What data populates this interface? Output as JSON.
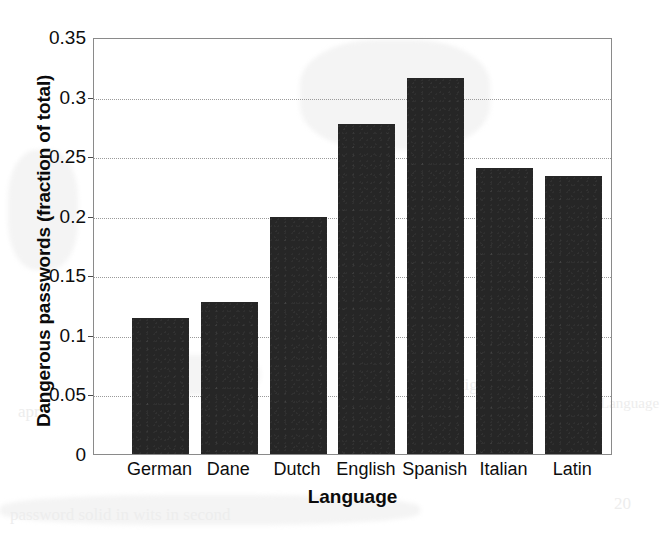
{
  "chart_data": {
    "type": "bar",
    "title": "",
    "subtitle": "",
    "xlabel": "Language",
    "ylabel": "Dangerous passwords (fraction of total)",
    "categories": [
      "German",
      "Dane",
      "Dutch",
      "English",
      "Spanish",
      "Italian",
      "Latin"
    ],
    "values": [
      0.114,
      0.128,
      0.199,
      0.277,
      0.316,
      0.24,
      0.233
    ],
    "series": [
      {
        "name": "Dangerous passwords",
        "values": [
          0.114,
          0.128,
          0.199,
          0.277,
          0.316,
          0.24,
          0.233
        ]
      }
    ],
    "ylim": [
      0,
      0.35
    ],
    "ytick_values": [
      0,
      0.05,
      0.1,
      0.15,
      0.2,
      0.25,
      0.3,
      0.35
    ],
    "ytick_labels": [
      "0",
      "0.05",
      "0.1",
      "0.15",
      "0.2",
      "0.25",
      "0.3",
      "0.35"
    ],
    "grid": true,
    "grid_axis": "y",
    "legend": null,
    "legend_position": "none",
    "bar_color": "#262626",
    "background_color": "#ffffff",
    "axis_color": "#8a8a8a",
    "gridline_color": "#9a9a9a",
    "annotations": []
  },
  "artifacts": {
    "bleed_text": [
      {
        "text": "Figure",
        "x": 455,
        "y": 375,
        "size": 17
      },
      {
        "text": "apr",
        "x": 18,
        "y": 402,
        "size": 17
      },
      {
        "text": "password solid in wits in second",
        "x": 10,
        "y": 505,
        "size": 17
      },
      {
        "text": "Language",
        "x": 600,
        "y": 395,
        "size": 15
      },
      {
        "text": "20",
        "x": 614,
        "y": 494,
        "size": 17
      }
    ]
  }
}
